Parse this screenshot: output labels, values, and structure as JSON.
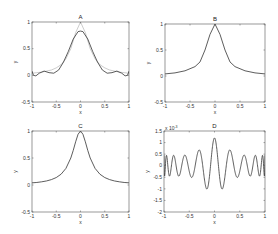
{
  "chart_data": [
    {
      "id": "A",
      "type": "line",
      "title": "A",
      "xlabel": "x",
      "ylabel": "y",
      "xlim": [
        -1,
        1
      ],
      "ylim": [
        -0.5,
        1
      ],
      "xticks": [
        -1,
        -0.5,
        0,
        0.5,
        1
      ],
      "xticklabels": [
        "-1",
        "-0.5",
        "0",
        "0.5",
        "1"
      ],
      "yticks": [
        -0.5,
        0,
        0.5,
        1
      ],
      "yticklabels": [
        "-0.5",
        "0",
        "0.5",
        "1"
      ],
      "frame_px": {
        "left": 32,
        "top": 22,
        "right": 129,
        "bottom": 102
      },
      "series": [
        {
          "name": "reference",
          "style": "ref",
          "x": [
            -1,
            -0.9,
            -0.8,
            -0.7,
            -0.6,
            -0.5,
            -0.4,
            -0.3,
            -0.2,
            -0.1,
            0,
            0.1,
            0.2,
            0.3,
            0.4,
            0.5,
            0.6,
            0.7,
            0.8,
            0.9,
            1
          ],
          "y": [
            0.04,
            0.05,
            0.06,
            0.08,
            0.1,
            0.14,
            0.2,
            0.31,
            0.5,
            0.8,
            1.0,
            0.8,
            0.5,
            0.31,
            0.2,
            0.14,
            0.1,
            0.08,
            0.06,
            0.05,
            0.04
          ]
        },
        {
          "name": "approximation",
          "style": "main",
          "x": [
            -1,
            -0.97,
            -0.92,
            -0.85,
            -0.75,
            -0.65,
            -0.55,
            -0.45,
            -0.35,
            -0.25,
            -0.15,
            -0.05,
            0,
            0.05,
            0.15,
            0.25,
            0.35,
            0.45,
            0.55,
            0.65,
            0.75,
            0.85,
            0.92,
            0.97,
            1
          ],
          "y": [
            0.08,
            0.0,
            -0.01,
            0.04,
            0.08,
            0.05,
            0.04,
            0.1,
            0.25,
            0.45,
            0.68,
            0.82,
            0.83,
            0.82,
            0.68,
            0.45,
            0.25,
            0.1,
            0.04,
            0.05,
            0.08,
            0.04,
            -0.01,
            0.0,
            0.08
          ]
        }
      ]
    },
    {
      "id": "B",
      "type": "line",
      "title": "B",
      "xlabel": "x",
      "ylabel": "y",
      "xlim": [
        -1,
        1
      ],
      "ylim": [
        -0.5,
        1
      ],
      "xticks": [
        -1,
        -0.5,
        0,
        0.5,
        1
      ],
      "xticklabels": [
        "-1",
        "-0.5",
        "0",
        "0.5",
        "1"
      ],
      "yticks": [
        -0.5,
        0,
        0.5,
        1
      ],
      "yticklabels": [
        "-0.5",
        "0",
        "0.5",
        "1"
      ],
      "frame_px": {
        "left": 165,
        "top": 24,
        "right": 265,
        "bottom": 102
      },
      "series": [
        {
          "name": "approximation",
          "style": "main",
          "x": [
            -1,
            -0.8,
            -0.6,
            -0.4,
            -0.3,
            -0.2,
            -0.1,
            0,
            0.1,
            0.2,
            0.3,
            0.4,
            0.6,
            0.8,
            1
          ],
          "y": [
            0.04,
            0.06,
            0.1,
            0.18,
            0.27,
            0.5,
            0.8,
            1.0,
            0.8,
            0.5,
            0.27,
            0.18,
            0.1,
            0.06,
            0.04
          ]
        }
      ]
    },
    {
      "id": "C",
      "type": "line",
      "title": "C",
      "xlabel": "x",
      "ylabel": "y",
      "xlim": [
        -1,
        1
      ],
      "ylim": [
        -0.5,
        1
      ],
      "xticks": [
        -1,
        -0.5,
        0,
        0.5,
        1
      ],
      "xticklabels": [
        "-1",
        "-0.5",
        "0",
        "0.5",
        "1"
      ],
      "yticks": [
        -0.5,
        0,
        0.5,
        1
      ],
      "yticklabels": [
        "-0.5",
        "0",
        "0.5",
        "1"
      ],
      "frame_px": {
        "left": 32,
        "top": 131,
        "right": 129,
        "bottom": 212
      },
      "series": [
        {
          "name": "runge_function",
          "style": "main",
          "x": [
            -1,
            -0.9,
            -0.8,
            -0.7,
            -0.6,
            -0.5,
            -0.4,
            -0.3,
            -0.2,
            -0.15,
            -0.1,
            -0.05,
            0,
            0.05,
            0.1,
            0.15,
            0.2,
            0.3,
            0.4,
            0.5,
            0.6,
            0.7,
            0.8,
            0.9,
            1
          ],
          "y": [
            0.04,
            0.047,
            0.059,
            0.075,
            0.1,
            0.138,
            0.2,
            0.308,
            0.5,
            0.64,
            0.8,
            0.94,
            1.0,
            0.94,
            0.8,
            0.64,
            0.5,
            0.308,
            0.2,
            0.138,
            0.1,
            0.075,
            0.059,
            0.047,
            0.04
          ]
        }
      ]
    },
    {
      "id": "D",
      "type": "line",
      "title": "D",
      "xlabel": "x",
      "ylabel": "y",
      "y_multiplier": "x 10^-3",
      "xlim": [
        -1,
        1
      ],
      "ylim": [
        -2,
        1.5
      ],
      "xticks": [
        -1,
        -0.5,
        0,
        0.5,
        1
      ],
      "xticklabels": [
        "-1",
        "-0.5",
        "0",
        "0.5",
        "1"
      ],
      "yticks": [
        -2,
        -1.5,
        -1,
        -0.5,
        0,
        0.5,
        1,
        1.5
      ],
      "yticklabels": [
        "-2",
        "-1.5",
        "-1",
        "-0.5",
        "0",
        "0.5",
        "1",
        "1.5"
      ],
      "frame_px": {
        "left": 164,
        "top": 131,
        "right": 265,
        "bottom": 212
      },
      "series": [
        {
          "name": "error",
          "style": "main",
          "generator": {
            "kind": "modulated_oscillation",
            "cycles": 10,
            "edge_amplitude": 0.45,
            "center_amplitude": 1.2,
            "edge_chirp": true,
            "samples": 600
          }
        }
      ]
    }
  ],
  "labels": {
    "A": {
      "title": "A",
      "x": "x",
      "y": "y"
    },
    "B": {
      "title": "B",
      "x": "x",
      "y": "y"
    },
    "C": {
      "title": "C",
      "x": "x",
      "y": "y"
    },
    "D": {
      "title": "D",
      "x": "x",
      "y": "y",
      "multiplier": "x 10^-3"
    }
  }
}
